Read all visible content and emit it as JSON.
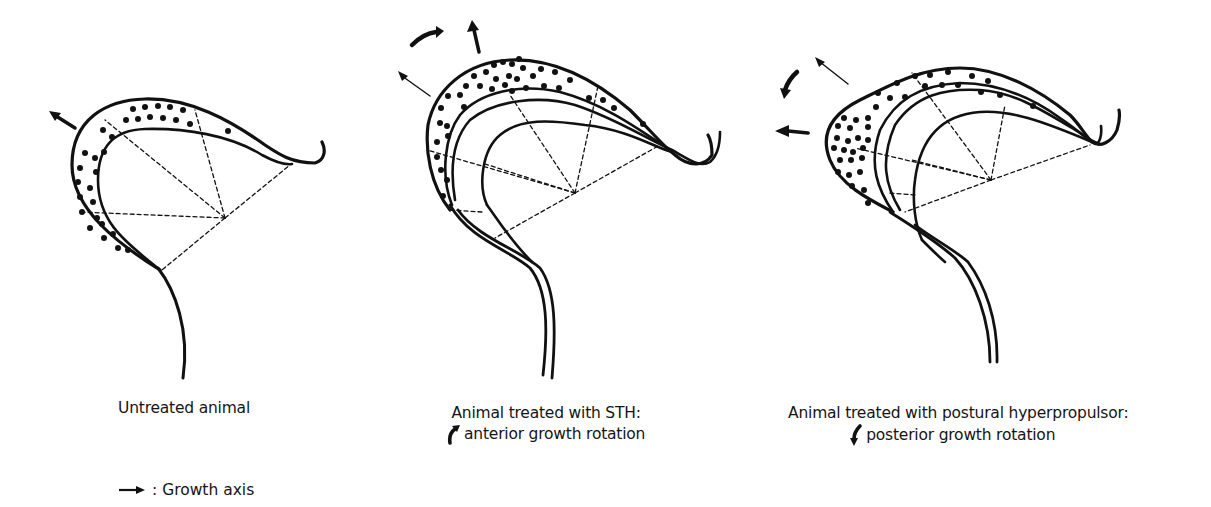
{
  "figure": {
    "panels": [
      {
        "id": "untreated",
        "caption_line1": "Untreated animal",
        "caption_line2": ""
      },
      {
        "id": "sth",
        "caption_line1": "Animal treated with STH:",
        "caption_line2": "anterior growth rotation",
        "rotation_icon": "curved-arrow-clockwise-icon"
      },
      {
        "id": "hyperpropulsor",
        "caption_line1": "Animal treated with postural hyperpropulsor:",
        "caption_line2": "posterior growth rotation",
        "rotation_icon": "curved-arrow-counterclockwise-icon"
      }
    ],
    "legend": {
      "symbol": "arrow-right-icon",
      "label": ": Growth axis"
    },
    "colors": {
      "ink": "#111111",
      "background": "#ffffff"
    }
  }
}
